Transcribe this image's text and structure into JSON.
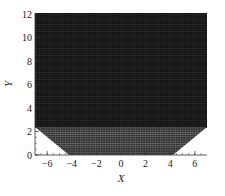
{
  "chart_data": {
    "type": "mesh",
    "title": "",
    "xlabel": "X",
    "ylabel": "Y",
    "xlim": [
      -7,
      7
    ],
    "ylim": [
      0,
      12
    ],
    "xticks": [
      -6,
      -4,
      -2,
      0,
      2,
      4,
      6
    ],
    "xtick_labels": [
      "-6",
      "-4",
      "-2",
      "0",
      "2",
      "4",
      "6"
    ],
    "yticks": [
      0,
      2,
      4,
      6,
      8,
      10,
      12
    ],
    "ytick_labels": [
      "0",
      "2",
      "4",
      "6",
      "8",
      "10",
      "12"
    ],
    "grid": false,
    "legend": null,
    "domain_outline": [
      [
        -7,
        12
      ],
      [
        7,
        12
      ],
      [
        7,
        2.5
      ],
      [
        4.2,
        0
      ],
      [
        -4.2,
        0
      ],
      [
        -7,
        2.5
      ]
    ],
    "regions": [
      {
        "name": "upper-rectangular-block",
        "y_range": [
          2.5,
          12
        ],
        "x_range": [
          -7,
          7
        ],
        "mesh_density": "very fine",
        "shade": "#141414"
      },
      {
        "name": "lower-trapezoid-block",
        "y_range": [
          0,
          2.5
        ],
        "x_range_bottom": [
          -4.2,
          4.2
        ],
        "x_range_top": [
          -7,
          7
        ],
        "mesh_density": "fine",
        "shade": "#3a3a3a"
      }
    ]
  }
}
